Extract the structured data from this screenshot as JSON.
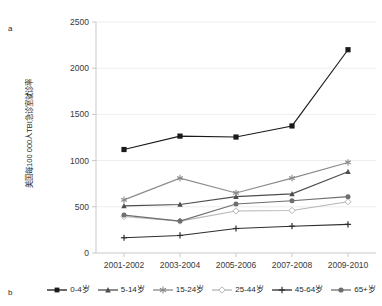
{
  "figure": {
    "panel_a_label": "a",
    "panel_b_label": "b"
  },
  "axes": {
    "ylabel": "美国每100 000人TBI急诊室就诊率",
    "yticks": [
      "0",
      "500",
      "1000",
      "1500",
      "2000",
      "2500"
    ],
    "xticks": [
      "2001-2002",
      "2003-2004",
      "2005-2006",
      "2007-2008",
      "2009-2010"
    ]
  },
  "legend": {
    "items": [
      {
        "label": "0-4岁",
        "marker": "square-marker",
        "color": "#1a1a1a"
      },
      {
        "label": "5-14岁",
        "marker": "triangle-marker",
        "color": "#4d4d4d"
      },
      {
        "label": "15-24岁",
        "marker": "asterisk-marker",
        "color": "#8a8a8a"
      },
      {
        "label": "25-44岁",
        "marker": "diamond-marker",
        "color": "#b5b5b5"
      },
      {
        "label": "45-64岁",
        "marker": "plus-marker",
        "color": "#2e2e2e"
      },
      {
        "label": "65+岁",
        "marker": "circle-marker",
        "color": "#6e6e6e"
      }
    ]
  },
  "chart_data": {
    "type": "line",
    "title": "",
    "xlabel": "",
    "ylabel": "美国每100 000人TBI急诊室就诊率",
    "categories": [
      "2001-2002",
      "2003-2004",
      "2005-2006",
      "2007-2008",
      "2009-2010"
    ],
    "ylim": [
      0,
      2500
    ],
    "ytick_step": 500,
    "grid": true,
    "legend_position": "bottom",
    "series": [
      {
        "name": "0-4岁",
        "marker": "square",
        "color": "#1a1a1a",
        "values": [
          1120,
          1265,
          1255,
          1375,
          2200
        ]
      },
      {
        "name": "5-14岁",
        "marker": "triangle",
        "color": "#4d4d4d",
        "values": [
          510,
          525,
          610,
          640,
          880
        ]
      },
      {
        "name": "15-24岁",
        "marker": "asterisk",
        "color": "#8a8a8a",
        "values": [
          575,
          810,
          650,
          810,
          980
        ]
      },
      {
        "name": "25-44岁",
        "marker": "diamond",
        "color": "#b5b5b5",
        "values": [
          395,
          345,
          455,
          460,
          555
        ]
      },
      {
        "name": "45-64岁",
        "marker": "plus",
        "color": "#2e2e2e",
        "values": [
          165,
          190,
          265,
          290,
          310
        ]
      },
      {
        "name": "65+岁",
        "marker": "circle",
        "color": "#6e6e6e",
        "values": [
          410,
          345,
          530,
          565,
          610
        ]
      }
    ]
  }
}
